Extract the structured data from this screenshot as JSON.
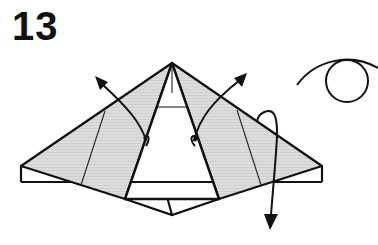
{
  "step": {
    "number": "13"
  },
  "diagram": {
    "colors": {
      "line": "#111111",
      "shaded_fill": "#d9d9d9",
      "background": "#ffffff"
    },
    "symbols": [
      {
        "name": "arrow-left-flap-open",
        "direction": "up-left"
      },
      {
        "name": "arrow-right-flap-open",
        "direction": "up-right"
      },
      {
        "name": "arrow-fold-down",
        "direction": "down"
      },
      {
        "name": "eye-symbol",
        "meaning": "view direction"
      }
    ]
  }
}
